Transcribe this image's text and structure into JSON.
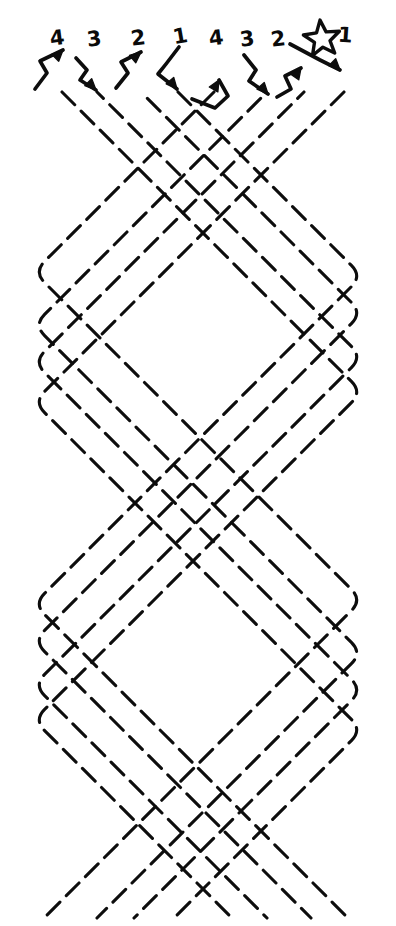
{
  "figure": {
    "kind": "hand-drawn braid / weaving strand diagram",
    "background_color": "#ffffff",
    "ink_color": "#0d0d0d",
    "stroke_width": 3.1,
    "dash_pattern": "18 9",
    "width": 396,
    "height": 926
  },
  "markers": {
    "star": {
      "name": "star",
      "cx": 322,
      "cy": 39,
      "r_outer": 19,
      "r_inner": 8.2,
      "rotation": -6
    }
  },
  "strand_labels": [
    {
      "text": "4",
      "x": 50,
      "y": 28,
      "tilt": "skew"
    },
    {
      "text": "3",
      "x": 87,
      "y": 29,
      "tilt": "skew"
    },
    {
      "text": "2",
      "x": 131,
      "y": 28,
      "tilt": "skew"
    },
    {
      "text": "1",
      "x": 173,
      "y": 26,
      "tilt": "skew2"
    },
    {
      "text": "4",
      "x": 209,
      "y": 28,
      "tilt": "skew"
    },
    {
      "text": "3",
      "x": 240,
      "y": 29,
      "tilt": "skew"
    },
    {
      "text": "2",
      "x": 271,
      "y": 29,
      "tilt": "skew"
    },
    {
      "text": "1",
      "x": 338,
      "y": 25,
      "tilt": "skew3"
    }
  ],
  "start_arrows": [
    {
      "name": "arrow-strand-4-left",
      "direction": "up-right",
      "path": "M 35 89 L 47 73 L 40 61 L 63 50",
      "head": 315
    },
    {
      "name": "arrow-strand-3-left",
      "direction": "down-right",
      "path": "M 76 58 L 87 70 L 80 80 L 96 90",
      "head": 45
    },
    {
      "name": "arrow-strand-2-left",
      "direction": "up-right",
      "path": "M 116 88 L 128 73 L 121 62 L 141 52",
      "head": 320
    },
    {
      "name": "arrow-strand-1-left",
      "direction": "down-right",
      "path": "M 179 47 L 166 64 L 158 74 L 177 89",
      "head": 50
    },
    {
      "name": "arrow-strand-4-right",
      "direction": "up-right",
      "path": "M 192 99 L 215 108 L 228 96 L 219 80",
      "head": 300
    },
    {
      "name": "arrow-strand-3-right",
      "direction": "down-right",
      "path": "M 244 55 L 256 70 L 249 81 L 268 94",
      "head": 48
    },
    {
      "name": "arrow-strand-2-right",
      "direction": "up-right",
      "path": "M 277 97 L 291 89 L 285 76 L 301 68",
      "head": 305
    },
    {
      "name": "arrow-strand-1-star",
      "direction": "down-right",
      "path": "M 290 44 L 320 60 L 340 70",
      "head": 45
    }
  ],
  "strands": {
    "count": 8,
    "left_bound": 34,
    "right_bound": 362,
    "top_start": 92,
    "bottom_end": 918,
    "slope_deg": 45,
    "entries": [
      {
        "label": "4",
        "start_x": 62,
        "start_dir": "down-right",
        "phase": 0
      },
      {
        "label": "3",
        "start_x": 97,
        "start_dir": "down-right",
        "phase": 1
      },
      {
        "label": "2",
        "start_x": 141,
        "start_dir": "down-right",
        "phase": 2
      },
      {
        "label": "1",
        "start_x": 178,
        "start_dir": "down-right",
        "phase": 3
      },
      {
        "label": "4",
        "start_x": 214,
        "start_dir": "down-left",
        "phase": 3
      },
      {
        "label": "3",
        "start_x": 267,
        "start_dir": "down-left",
        "phase": 2
      },
      {
        "label": "2",
        "start_x": 304,
        "start_dir": "down-left",
        "phase": 1
      },
      {
        "label": "1",
        "start_x": 344,
        "start_dir": "down-left",
        "phase": 0
      }
    ]
  },
  "caption": {
    "title": "",
    "note": ""
  }
}
